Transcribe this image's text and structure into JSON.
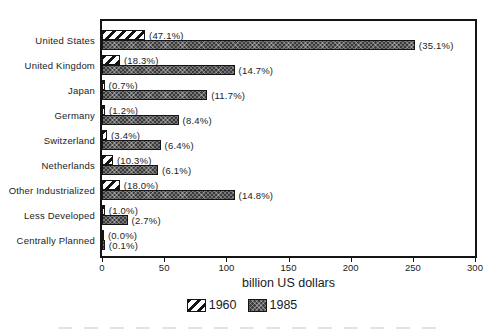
{
  "chart_data": {
    "type": "bar",
    "orientation": "horizontal",
    "title": "",
    "xlabel": "billion US dollars",
    "xlim": [
      0,
      300
    ],
    "xticks": [
      0,
      50,
      100,
      150,
      200,
      250,
      300
    ],
    "grid": false,
    "categories": [
      "United States",
      "United Kingdom",
      "Japan",
      "Germany",
      "Switzerland",
      "Netherlands",
      "Other Industrialized",
      "Less Developed",
      "Centrally Planned"
    ],
    "series": [
      {
        "name": "1960",
        "pattern": "diagonal-hatch",
        "values": [
          33,
          12.8,
          0.5,
          0.8,
          2.4,
          7.2,
          12.6,
          0.7,
          0
        ],
        "percent_labels": [
          "(47.1%)",
          "(18.3%)",
          "(0.7%)",
          "(1.2%)",
          "(3.4%)",
          "(10.3%)",
          "(18.0%)",
          "(1.0%)",
          "(0.0%)"
        ]
      },
      {
        "name": "1985",
        "pattern": "dark-crosshatch",
        "values": [
          250,
          105,
          83,
          60,
          45.5,
          43.5,
          105,
          19,
          0.7
        ],
        "percent_labels": [
          "(35.1%)",
          "(14.7%)",
          "(11.7%)",
          "(8.4%)",
          "(6.4%)",
          "(6.1%)",
          "(14.8%)",
          "(2.7%)",
          "(0.1%)"
        ]
      }
    ],
    "legend": {
      "entries": [
        "1960",
        "1985"
      ],
      "position": "bottom-center"
    }
  },
  "colors": {
    "background": "#ffffff",
    "ink": "#1b1b1b",
    "frame": "#141414",
    "bar_1960_fill": "#ffffff",
    "bar_1985_fill": "#3b3b3b"
  }
}
